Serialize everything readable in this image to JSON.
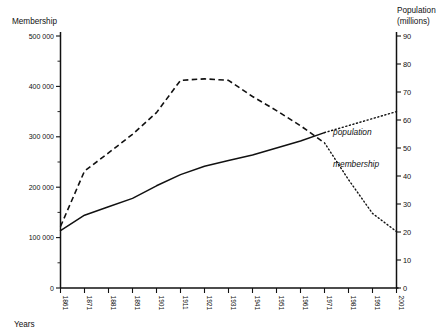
{
  "chart_data": {
    "type": "line",
    "title": "",
    "xlabel": "Years",
    "ylabel": "Membership",
    "y2label": "Population (millions)",
    "grid": false,
    "legend_position": "inline-right",
    "x": [
      1861,
      1871,
      1881,
      1891,
      1901,
      1911,
      1921,
      1931,
      1941,
      1951,
      1961,
      1971,
      1981,
      1991,
      2001
    ],
    "xlim": [
      1861,
      2001
    ],
    "ylim": [
      0,
      500000
    ],
    "y2lim": [
      0,
      90
    ],
    "y_ticks": [
      "0",
      "100 000",
      "200 000",
      "300 000",
      "400 000",
      "500 000"
    ],
    "y_tick_values": [
      0,
      100000,
      200000,
      300000,
      400000,
      500000
    ],
    "y_minor_step": 50000,
    "y2_ticks": [
      "0",
      "10",
      "20",
      "30",
      "40",
      "50",
      "60",
      "70",
      "80",
      "90"
    ],
    "y2_tick_values": [
      0,
      10,
      20,
      30,
      40,
      50,
      60,
      70,
      80,
      90
    ],
    "x_tick_labels": [
      "1861",
      "1871",
      "1881",
      "1891",
      "1901",
      "1911",
      "1921",
      "1931",
      "1941",
      "1951",
      "1961",
      "1971",
      "1981",
      "1991",
      "2001"
    ],
    "series": [
      {
        "name": "membership",
        "label": "membership",
        "axis": "left",
        "style": "dashed",
        "projection_style": "dotted",
        "projection_from": 1971,
        "values": [
          122000,
          232000,
          268000,
          305000,
          348000,
          412000,
          415000,
          412000,
          380000,
          352000,
          322000,
          288000,
          215000,
          148000,
          112000
        ]
      },
      {
        "name": "population",
        "label": "population",
        "axis": "right",
        "style": "solid",
        "projection_style": "dotted",
        "projection_from": 1971,
        "values": [
          20.5,
          26.0,
          29.0,
          32.0,
          36.5,
          40.5,
          43.5,
          45.5,
          47.5,
          50.0,
          52.5,
          55.5,
          58.0,
          60.5,
          63.0
        ]
      }
    ]
  },
  "labels": {
    "left_axis_title": "Membership",
    "right_axis_title_line1": "Population",
    "right_axis_title_line2": "(millions)",
    "x_axis_title": "Years",
    "series_population": "population",
    "series_membership": "membership"
  }
}
